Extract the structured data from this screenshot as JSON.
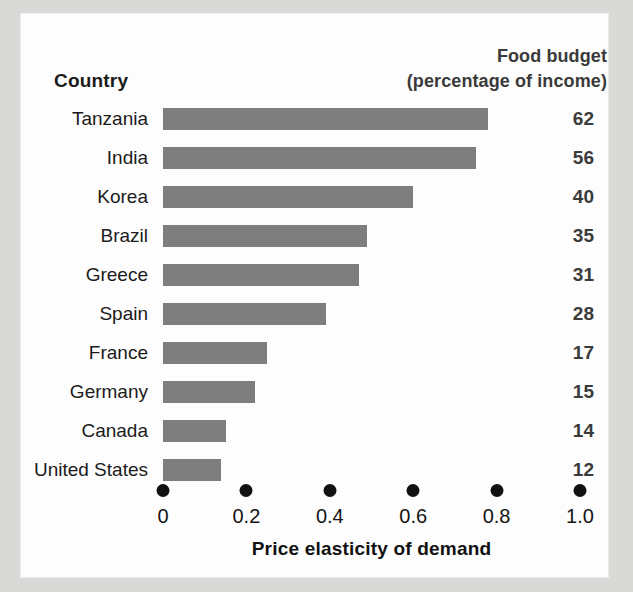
{
  "header": {
    "country_label": "Country",
    "budget_label_line1": "Food budget",
    "budget_label_line2": "(percentage of income)"
  },
  "colors": {
    "bar": "#7e7e7e",
    "page_background": "#d9d9d7",
    "panel_background": "#fdfdfd",
    "value_text": "#3b3b3b",
    "axis_dot": "#111111"
  },
  "chart_data": {
    "type": "bar",
    "orientation": "horizontal",
    "title": "",
    "xlabel": "Price elasticity of demand",
    "ylabel": "Country",
    "xlim": [
      0,
      1.0
    ],
    "grid": false,
    "legend": "none",
    "xticks": [
      "0",
      "0.2",
      "0.4",
      "0.6",
      "0.8",
      "1.0"
    ],
    "xtick_values": [
      0,
      0.2,
      0.4,
      0.6,
      0.8,
      1.0
    ],
    "categories": [
      "Tanzania",
      "India",
      "Korea",
      "Brazil",
      "Greece",
      "Spain",
      "France",
      "Germany",
      "Canada",
      "United States"
    ],
    "values": [
      0.78,
      0.75,
      0.6,
      0.49,
      0.47,
      0.39,
      0.25,
      0.22,
      0.15,
      0.14
    ],
    "series": [
      {
        "name": "Price elasticity of demand",
        "values": [
          0.78,
          0.75,
          0.6,
          0.49,
          0.47,
          0.39,
          0.25,
          0.22,
          0.15,
          0.14
        ]
      },
      {
        "name": "Food budget (percentage of income)",
        "values": [
          62,
          56,
          40,
          35,
          31,
          28,
          17,
          15,
          14,
          12
        ],
        "display": "text-column"
      }
    ],
    "annotations": [
      {
        "category": "Tanzania",
        "text": "62"
      },
      {
        "category": "India",
        "text": "56"
      },
      {
        "category": "Korea",
        "text": "40"
      },
      {
        "category": "Brazil",
        "text": "35"
      },
      {
        "category": "Greece",
        "text": "31"
      },
      {
        "category": "Spain",
        "text": "28"
      },
      {
        "category": "France",
        "text": "17"
      },
      {
        "category": "Germany",
        "text": "15"
      },
      {
        "category": "Canada",
        "text": "14"
      },
      {
        "category": "United States",
        "text": "12"
      }
    ]
  }
}
